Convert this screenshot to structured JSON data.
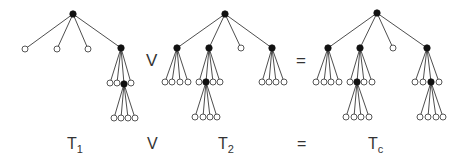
{
  "diagram": {
    "operators": [
      {
        "id": "join",
        "text": "V",
        "x": 146,
        "y": 60
      },
      {
        "id": "equals",
        "text": "=",
        "x": 296,
        "y": 60
      }
    ],
    "labels": [
      {
        "id": "t1",
        "main": "T",
        "sub": "1",
        "x": 67,
        "y": 144
      },
      {
        "id": "join",
        "main": "V",
        "sub": "",
        "x": 147,
        "y": 144
      },
      {
        "id": "t2",
        "main": "T",
        "sub": "2",
        "x": 218,
        "y": 144
      },
      {
        "id": "equals",
        "main": "=",
        "sub": "",
        "x": 297,
        "y": 144
      },
      {
        "id": "tc",
        "main": "T",
        "sub": "c",
        "x": 368,
        "y": 144
      }
    ],
    "trees": [
      {
        "name": "T1",
        "root": {
          "x": 73,
          "y": 14,
          "filled": true,
          "children": [
            {
              "x": 25,
              "y": 49,
              "filled": false
            },
            {
              "x": 57,
              "y": 49,
              "filled": false
            },
            {
              "x": 88,
              "y": 49,
              "filled": false
            },
            {
              "x": 121,
              "y": 48,
              "filled": true,
              "children": [
                {
                  "x": 110,
                  "y": 83,
                  "filled": false
                },
                {
                  "x": 117,
                  "y": 83,
                  "filled": false
                },
                {
                  "x": 124,
                  "y": 84,
                  "filled": true,
                  "children": [
                    {
                      "x": 114,
                      "y": 118,
                      "filled": false
                    },
                    {
                      "x": 121,
                      "y": 118,
                      "filled": false
                    },
                    {
                      "x": 128,
                      "y": 118,
                      "filled": false
                    },
                    {
                      "x": 135,
                      "y": 118,
                      "filled": false
                    }
                  ]
                },
                {
                  "x": 131,
                  "y": 83,
                  "filled": false
                }
              ]
            }
          ]
        }
      },
      {
        "name": "T2",
        "root": {
          "x": 225,
          "y": 14,
          "filled": true,
          "children": [
            {
              "x": 177,
              "y": 48,
              "filled": true,
              "children": [
                {
                  "x": 165,
                  "y": 82,
                  "filled": false
                },
                {
                  "x": 172,
                  "y": 82,
                  "filled": false
                },
                {
                  "x": 180,
                  "y": 82,
                  "filled": false
                },
                {
                  "x": 188,
                  "y": 82,
                  "filled": false
                }
              ]
            },
            {
              "x": 209,
              "y": 48,
              "filled": true,
              "children": [
                {
                  "x": 199,
                  "y": 82,
                  "filled": false
                },
                {
                  "x": 206,
                  "y": 82,
                  "filled": true,
                  "children": [
                    {
                      "x": 195,
                      "y": 117,
                      "filled": false
                    },
                    {
                      "x": 203,
                      "y": 117,
                      "filled": false
                    },
                    {
                      "x": 210,
                      "y": 117,
                      "filled": false
                    },
                    {
                      "x": 217,
                      "y": 117,
                      "filled": false
                    }
                  ]
                },
                {
                  "x": 213,
                  "y": 82,
                  "filled": false
                },
                {
                  "x": 220,
                  "y": 82,
                  "filled": false
                }
              ]
            },
            {
              "x": 241,
              "y": 48,
              "filled": false
            },
            {
              "x": 272,
              "y": 48,
              "filled": true,
              "children": [
                {
                  "x": 262,
                  "y": 82,
                  "filled": false
                },
                {
                  "x": 269,
                  "y": 82,
                  "filled": false
                },
                {
                  "x": 276,
                  "y": 82,
                  "filled": false
                },
                {
                  "x": 284,
                  "y": 82,
                  "filled": false
                }
              ]
            }
          ]
        }
      },
      {
        "name": "Tc",
        "root": {
          "x": 377,
          "y": 13,
          "filled": true,
          "children": [
            {
              "x": 328,
              "y": 48,
              "filled": true,
              "children": [
                {
                  "x": 316,
                  "y": 82,
                  "filled": false
                },
                {
                  "x": 324,
                  "y": 82,
                  "filled": false
                },
                {
                  "x": 331,
                  "y": 82,
                  "filled": false
                },
                {
                  "x": 339,
                  "y": 82,
                  "filled": false
                }
              ]
            },
            {
              "x": 360,
              "y": 48,
              "filled": true,
              "children": [
                {
                  "x": 350,
                  "y": 82,
                  "filled": false
                },
                {
                  "x": 357,
                  "y": 82,
                  "filled": true,
                  "children": [
                    {
                      "x": 346,
                      "y": 117,
                      "filled": false
                    },
                    {
                      "x": 354,
                      "y": 117,
                      "filled": false
                    },
                    {
                      "x": 361,
                      "y": 117,
                      "filled": false
                    },
                    {
                      "x": 369,
                      "y": 117,
                      "filled": false
                    }
                  ]
                },
                {
                  "x": 364,
                  "y": 82,
                  "filled": false
                },
                {
                  "x": 372,
                  "y": 82,
                  "filled": false
                }
              ]
            },
            {
              "x": 393,
              "y": 48,
              "filled": false
            },
            {
              "x": 427,
              "y": 48,
              "filled": true,
              "children": [
                {
                  "x": 415,
                  "y": 82,
                  "filled": false
                },
                {
                  "x": 423,
                  "y": 82,
                  "filled": false
                },
                {
                  "x": 431,
                  "y": 82,
                  "filled": true,
                  "children": [
                    {
                      "x": 420,
                      "y": 117,
                      "filled": false
                    },
                    {
                      "x": 428,
                      "y": 117,
                      "filled": false
                    },
                    {
                      "x": 436,
                      "y": 117,
                      "filled": false
                    },
                    {
                      "x": 443,
                      "y": 117,
                      "filled": false
                    }
                  ]
                },
                {
                  "x": 439,
                  "y": 82,
                  "filled": false
                }
              ]
            }
          ]
        }
      }
    ],
    "style": {
      "filled_color": "#111111",
      "open_fill": "#ffffff",
      "edge_color": "#3a3a3a",
      "node_radius": 3
    }
  }
}
